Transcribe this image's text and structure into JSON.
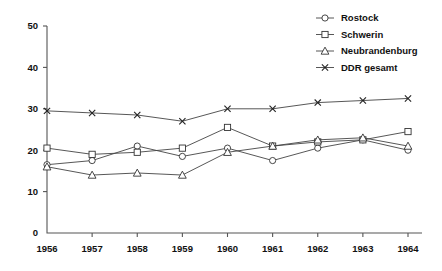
{
  "chart_data": {
    "type": "line",
    "title": "",
    "xlabel": "",
    "ylabel": "",
    "x": [
      1956,
      1957,
      1958,
      1959,
      1960,
      1961,
      1962,
      1963,
      1964
    ],
    "xtick_labels": [
      "1956",
      "1957",
      "1958",
      "1959",
      "1960",
      "1961",
      "1962",
      "1963",
      "1964"
    ],
    "ytick_labels": [
      "0",
      "10",
      "20",
      "30",
      "40",
      "50"
    ],
    "yticks": [
      0,
      10,
      20,
      30,
      40,
      50
    ],
    "ylim": [
      0,
      50
    ],
    "grid": false,
    "legend_position": "top-right",
    "series": [
      {
        "name": "Rostock",
        "marker": "circle",
        "values": [
          16.5,
          17.5,
          21.0,
          18.5,
          20.5,
          17.5,
          20.5,
          22.5,
          20.0
        ]
      },
      {
        "name": "Schwerin",
        "marker": "square",
        "values": [
          20.5,
          19.0,
          19.5,
          20.5,
          25.5,
          21.0,
          22.0,
          22.5,
          24.5
        ]
      },
      {
        "name": "Neubrandenburg",
        "marker": "triangle",
        "values": [
          16.0,
          14.0,
          14.5,
          14.0,
          19.5,
          21.0,
          22.5,
          23.0,
          21.0
        ]
      },
      {
        "name": "DDR gesamt",
        "marker": "x",
        "values": [
          29.5,
          29.0,
          28.5,
          27.0,
          30.0,
          30.0,
          31.5,
          32.0,
          32.5
        ]
      }
    ]
  },
  "legend": {
    "entries": [
      {
        "label": "Rostock"
      },
      {
        "label": "Schwerin"
      },
      {
        "label": "Neubrandenburg"
      },
      {
        "label": "DDR gesamt"
      }
    ]
  }
}
